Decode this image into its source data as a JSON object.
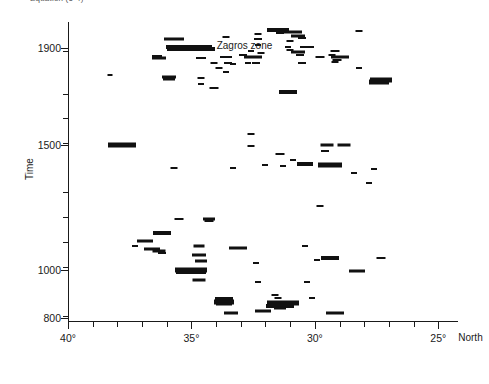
{
  "figure": {
    "top_caption": "Equation (6-4)",
    "yaxis_title": "Time",
    "xaxis_title": "Zagros zone",
    "xaxis_suffix": "North"
  },
  "chart_data": {
    "type": "scatter",
    "title": "",
    "xlabel": "Zagros zone",
    "ylabel": "Time",
    "grid": false,
    "legend": null,
    "xlim": [
      40,
      24.2
    ],
    "xlabel_suffix": "North",
    "x_major_ticks": [
      40,
      35,
      30,
      25
    ],
    "x_major_tick_labels": [
      "40°",
      "35°",
      "30°",
      "25°"
    ],
    "x_minor_ticks": [
      39,
      38,
      37,
      36,
      34,
      33,
      32,
      31,
      29,
      28,
      27,
      26
    ],
    "ylim": [
      780,
      1990
    ],
    "y_major_ticks": [
      1900,
      1500,
      1000,
      800
    ],
    "y_major_tick_labels": [
      "1900",
      "1500",
      "1000",
      "800"
    ],
    "y_axis_note": "non-linear compressed time axis",
    "y_minor_tick_pixels": [
      29,
      72,
      96,
      121,
      170,
      195,
      220,
      245,
      294
    ],
    "marker_style": "horizontal line segment (earthquake event, length = uncertainty/intensity)",
    "points": [
      {
        "x": 35.7,
        "y": 1930,
        "w": 20,
        "h": 3
      },
      {
        "x": 35.0,
        "y": 1895,
        "w": 48,
        "h": 4
      },
      {
        "x": 35.1,
        "y": 1902,
        "w": 46,
        "h": 4
      },
      {
        "x": 32.3,
        "y": 1948,
        "w": 7,
        "h": 2
      },
      {
        "x": 32.3,
        "y": 1930,
        "w": 8,
        "h": 2
      },
      {
        "x": 32.3,
        "y": 1912,
        "w": 6,
        "h": 2
      },
      {
        "x": 30.3,
        "y": 1905,
        "w": 14,
        "h": 2
      },
      {
        "x": 29.2,
        "y": 1888,
        "w": 9,
        "h": 2
      },
      {
        "x": 29.3,
        "y": 1873,
        "w": 7,
        "h": 2
      },
      {
        "x": 29.0,
        "y": 1862,
        "w": 18,
        "h": 3
      },
      {
        "x": 29.1,
        "y": 1850,
        "w": 9,
        "h": 2
      },
      {
        "x": 29.2,
        "y": 1842,
        "w": 7,
        "h": 2
      },
      {
        "x": 36.4,
        "y": 1868,
        "w": 10,
        "h": 2
      },
      {
        "x": 36.3,
        "y": 1858,
        "w": 14,
        "h": 3
      },
      {
        "x": 34.6,
        "y": 1857,
        "w": 10,
        "h": 2
      },
      {
        "x": 34.1,
        "y": 1840,
        "w": 7,
        "h": 2
      },
      {
        "x": 33.3,
        "y": 1835,
        "w": 6,
        "h": 2
      },
      {
        "x": 32.4,
        "y": 1840,
        "w": 8,
        "h": 2
      },
      {
        "x": 38.3,
        "y": 1790,
        "w": 5,
        "h": 2
      },
      {
        "x": 35.9,
        "y": 1782,
        "w": 14,
        "h": 3
      },
      {
        "x": 35.9,
        "y": 1773,
        "w": 12,
        "h": 3
      },
      {
        "x": 34.6,
        "y": 1778,
        "w": 7,
        "h": 2
      },
      {
        "x": 31.5,
        "y": 1962,
        "w": 22,
        "h": 4
      },
      {
        "x": 31.4,
        "y": 1952,
        "w": 8,
        "h": 2
      },
      {
        "x": 30.9,
        "y": 1955,
        "w": 18,
        "h": 3
      },
      {
        "x": 30.7,
        "y": 1942,
        "w": 14,
        "h": 3
      },
      {
        "x": 30.5,
        "y": 1935,
        "w": 8,
        "h": 2
      },
      {
        "x": 31.0,
        "y": 1925,
        "w": 7,
        "h": 2
      },
      {
        "x": 28.2,
        "y": 1958,
        "w": 7,
        "h": 2
      },
      {
        "x": 33.6,
        "y": 1938,
        "w": 7,
        "h": 2
      },
      {
        "x": 31.1,
        "y": 1905,
        "w": 6,
        "h": 2
      },
      {
        "x": 31.0,
        "y": 1890,
        "w": 7,
        "h": 2
      },
      {
        "x": 32.6,
        "y": 1888,
        "w": 6,
        "h": 2
      },
      {
        "x": 32.2,
        "y": 1880,
        "w": 7,
        "h": 2
      },
      {
        "x": 32.5,
        "y": 1862,
        "w": 18,
        "h": 3
      },
      {
        "x": 32.9,
        "y": 1870,
        "w": 8,
        "h": 2
      },
      {
        "x": 33.6,
        "y": 1862,
        "w": 12,
        "h": 2
      },
      {
        "x": 30.7,
        "y": 1885,
        "w": 14,
        "h": 3
      },
      {
        "x": 30.6,
        "y": 1872,
        "w": 8,
        "h": 2
      },
      {
        "x": 29.8,
        "y": 1862,
        "w": 9,
        "h": 2
      },
      {
        "x": 33.5,
        "y": 1838,
        "w": 8,
        "h": 2
      },
      {
        "x": 32.7,
        "y": 1838,
        "w": 6,
        "h": 2
      },
      {
        "x": 30.5,
        "y": 1840,
        "w": 8,
        "h": 2
      },
      {
        "x": 33.9,
        "y": 1818,
        "w": 7,
        "h": 2
      },
      {
        "x": 33.6,
        "y": 1800,
        "w": 6,
        "h": 2
      },
      {
        "x": 28.2,
        "y": 1818,
        "w": 6,
        "h": 2
      },
      {
        "x": 34.6,
        "y": 1752,
        "w": 6,
        "h": 2
      },
      {
        "x": 27.3,
        "y": 1770,
        "w": 22,
        "h": 5
      },
      {
        "x": 27.4,
        "y": 1760,
        "w": 20,
        "h": 5
      },
      {
        "x": 34.1,
        "y": 1735,
        "w": 9,
        "h": 2
      },
      {
        "x": 31.1,
        "y": 1718,
        "w": 18,
        "h": 4
      },
      {
        "x": 37.8,
        "y": 1500,
        "w": 28,
        "h": 5
      },
      {
        "x": 32.6,
        "y": 1545,
        "w": 7,
        "h": 2
      },
      {
        "x": 32.6,
        "y": 1498,
        "w": 7,
        "h": 2
      },
      {
        "x": 29.5,
        "y": 1500,
        "w": 13,
        "h": 3
      },
      {
        "x": 28.8,
        "y": 1502,
        "w": 13,
        "h": 3
      },
      {
        "x": 29.6,
        "y": 1478,
        "w": 8,
        "h": 2
      },
      {
        "x": 32.0,
        "y": 1420,
        "w": 6,
        "h": 2
      },
      {
        "x": 30.4,
        "y": 1425,
        "w": 16,
        "h": 4
      },
      {
        "x": 30.9,
        "y": 1440,
        "w": 6,
        "h": 2
      },
      {
        "x": 31.3,
        "y": 1415,
        "w": 6,
        "h": 2
      },
      {
        "x": 27.6,
        "y": 1405,
        "w": 6,
        "h": 2
      },
      {
        "x": 35.7,
        "y": 1410,
        "w": 7,
        "h": 2
      },
      {
        "x": 33.3,
        "y": 1410,
        "w": 6,
        "h": 2
      },
      {
        "x": 31.4,
        "y": 1465,
        "w": 9,
        "h": 2
      },
      {
        "x": 29.4,
        "y": 1420,
        "w": 24,
        "h": 5
      },
      {
        "x": 28.4,
        "y": 1388,
        "w": 6,
        "h": 2
      },
      {
        "x": 27.8,
        "y": 1350,
        "w": 6,
        "h": 2
      },
      {
        "x": 29.8,
        "y": 1255,
        "w": 7,
        "h": 2
      },
      {
        "x": 35.5,
        "y": 1205,
        "w": 9,
        "h": 2
      },
      {
        "x": 34.3,
        "y": 1205,
        "w": 12,
        "h": 3
      },
      {
        "x": 34.3,
        "y": 1195,
        "w": 9,
        "h": 2
      },
      {
        "x": 36.9,
        "y": 1118,
        "w": 16,
        "h": 3
      },
      {
        "x": 36.2,
        "y": 1150,
        "w": 18,
        "h": 4
      },
      {
        "x": 37.3,
        "y": 1098,
        "w": 6,
        "h": 2
      },
      {
        "x": 36.6,
        "y": 1085,
        "w": 16,
        "h": 3
      },
      {
        "x": 36.3,
        "y": 1075,
        "w": 13,
        "h": 3
      },
      {
        "x": 36.2,
        "y": 1068,
        "w": 8,
        "h": 2
      },
      {
        "x": 34.7,
        "y": 1095,
        "w": 11,
        "h": 3
      },
      {
        "x": 33.1,
        "y": 1090,
        "w": 18,
        "h": 3
      },
      {
        "x": 34.7,
        "y": 1060,
        "w": 14,
        "h": 3
      },
      {
        "x": 30.4,
        "y": 1098,
        "w": 6,
        "h": 2
      },
      {
        "x": 34.6,
        "y": 1035,
        "w": 12,
        "h": 3
      },
      {
        "x": 32.4,
        "y": 1030,
        "w": 6,
        "h": 2
      },
      {
        "x": 29.9,
        "y": 1042,
        "w": 6,
        "h": 2
      },
      {
        "x": 29.4,
        "y": 1048,
        "w": 18,
        "h": 4
      },
      {
        "x": 27.3,
        "y": 1050,
        "w": 9,
        "h": 2
      },
      {
        "x": 35.0,
        "y": 1000,
        "w": 32,
        "h": 5
      },
      {
        "x": 35.0,
        "y": 990,
        "w": 30,
        "h": 4
      },
      {
        "x": 28.3,
        "y": 995,
        "w": 16,
        "h": 3
      },
      {
        "x": 34.7,
        "y": 958,
        "w": 13,
        "h": 3
      },
      {
        "x": 32.3,
        "y": 952,
        "w": 6,
        "h": 2
      },
      {
        "x": 30.3,
        "y": 950,
        "w": 6,
        "h": 2
      },
      {
        "x": 31.6,
        "y": 895,
        "w": 7,
        "h": 2
      },
      {
        "x": 31.5,
        "y": 882,
        "w": 7,
        "h": 2
      },
      {
        "x": 30.1,
        "y": 885,
        "w": 6,
        "h": 2
      },
      {
        "x": 33.7,
        "y": 880,
        "w": 18,
        "h": 4
      },
      {
        "x": 33.7,
        "y": 868,
        "w": 20,
        "h": 5
      },
      {
        "x": 33.7,
        "y": 858,
        "w": 16,
        "h": 3
      },
      {
        "x": 31.3,
        "y": 862,
        "w": 32,
        "h": 5
      },
      {
        "x": 31.4,
        "y": 852,
        "w": 28,
        "h": 4
      },
      {
        "x": 31.4,
        "y": 842,
        "w": 12,
        "h": 3
      },
      {
        "x": 32.1,
        "y": 830,
        "w": 16,
        "h": 3
      },
      {
        "x": 29.2,
        "y": 822,
        "w": 18,
        "h": 3
      },
      {
        "x": 33.4,
        "y": 822,
        "w": 14,
        "h": 3
      }
    ]
  }
}
